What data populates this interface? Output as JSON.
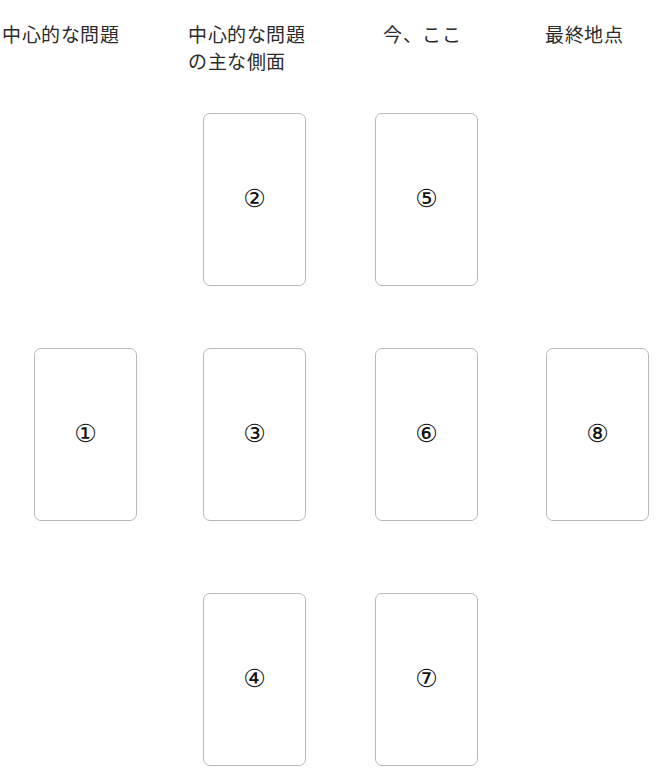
{
  "page": {
    "background_color": "#ffffff",
    "width": 667,
    "height": 784
  },
  "style": {
    "card_border_color": "#b9b9b9",
    "card_fill_color": "#ffffff",
    "text_color": "#2b2b2b",
    "number_color": "#111111"
  },
  "columns": [
    {
      "id": "col-1",
      "header": "中心的な問題",
      "header_x": 2,
      "header_y": 22,
      "header_width": 180,
      "card_x": 34
    },
    {
      "id": "col-2",
      "header": "中心的な問題\nの主な側面",
      "header_x": 188,
      "header_y": 22,
      "header_width": 170,
      "card_x": 203
    },
    {
      "id": "col-3",
      "header": "今、ここ",
      "header_x": 383,
      "header_y": 22,
      "header_width": 150,
      "card_x": 375
    },
    {
      "id": "col-4",
      "header": "最終地点",
      "header_x": 545,
      "header_y": 22,
      "header_width": 150,
      "card_x": 546
    }
  ],
  "rows": [
    {
      "id": "row-top",
      "y": 113
    },
    {
      "id": "row-middle",
      "y": 348
    },
    {
      "id": "row-bottom",
      "y": 593
    }
  ],
  "card_size": {
    "width": 103,
    "height": 173
  },
  "cards": [
    {
      "id": "card-2",
      "number": "②",
      "digit": 2,
      "column": "col-2",
      "row": "row-top",
      "x": 203,
      "y": 113
    },
    {
      "id": "card-5",
      "number": "⑤",
      "digit": 5,
      "column": "col-3",
      "row": "row-top",
      "x": 375,
      "y": 113
    },
    {
      "id": "card-1",
      "number": "①",
      "digit": 1,
      "column": "col-1",
      "row": "row-middle",
      "x": 34,
      "y": 348
    },
    {
      "id": "card-3",
      "number": "③",
      "digit": 3,
      "column": "col-2",
      "row": "row-middle",
      "x": 203,
      "y": 348
    },
    {
      "id": "card-6",
      "number": "⑥",
      "digit": 6,
      "column": "col-3",
      "row": "row-middle",
      "x": 375,
      "y": 348
    },
    {
      "id": "card-8",
      "number": "⑧",
      "digit": 8,
      "column": "col-4",
      "row": "row-middle",
      "x": 546,
      "y": 348
    },
    {
      "id": "card-4",
      "number": "④",
      "digit": 4,
      "column": "col-2",
      "row": "row-bottom",
      "x": 203,
      "y": 593
    },
    {
      "id": "card-7",
      "number": "⑦",
      "digit": 7,
      "column": "col-3",
      "row": "row-bottom",
      "x": 375,
      "y": 593
    }
  ]
}
